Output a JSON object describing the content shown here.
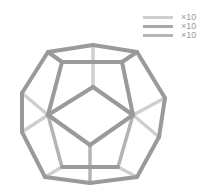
{
  "figure": {
    "type": "dodecahedron-wireframe",
    "colors": {
      "front": "#9a9a9a",
      "mid": "#b4b4b4",
      "back": "#cfcfcf"
    },
    "vertices": {
      "o0": [
        48,
        52
      ],
      "o1": [
        93,
        45
      ],
      "o2": [
        137,
        52
      ],
      "o3": [
        165,
        98
      ],
      "o4": [
        159,
        137
      ],
      "o5": [
        137,
        177
      ],
      "o6": [
        90,
        183
      ],
      "o7": [
        45,
        177
      ],
      "o8": [
        22,
        132
      ],
      "o9": [
        22,
        93
      ],
      "t0": [
        62,
        62
      ],
      "t1": [
        122,
        62
      ],
      "d0": [
        93,
        87
      ],
      "d1": [
        133,
        115
      ],
      "d2": [
        90,
        145
      ],
      "d3": [
        48,
        115
      ],
      "b0": [
        62,
        167
      ],
      "b1": [
        118,
        167
      ],
      "hR": [
        133,
        115
      ],
      "hL": [
        48,
        115
      ],
      "bx": [
        90,
        145
      ],
      "topc": [
        93,
        45
      ]
    },
    "edges": [
      {
        "a": "o0",
        "b": "o1",
        "layer": "front"
      },
      {
        "a": "o1",
        "b": "o2",
        "layer": "front"
      },
      {
        "a": "o2",
        "b": "o3",
        "layer": "front"
      },
      {
        "a": "o3",
        "b": "o4",
        "layer": "front"
      },
      {
        "a": "o4",
        "b": "o5",
        "layer": "front"
      },
      {
        "a": "o5",
        "b": "o6",
        "layer": "front"
      },
      {
        "a": "o6",
        "b": "o7",
        "layer": "front"
      },
      {
        "a": "o7",
        "b": "o8",
        "layer": "front"
      },
      {
        "a": "o8",
        "b": "o9",
        "layer": "front"
      },
      {
        "a": "o9",
        "b": "o0",
        "layer": "front"
      },
      {
        "a": "o0",
        "b": "t0",
        "layer": "front"
      },
      {
        "a": "t0",
        "b": "t1",
        "layer": "front"
      },
      {
        "a": "t1",
        "b": "o2",
        "layer": "front"
      },
      {
        "a": "t0",
        "b": "d3",
        "layer": "front"
      },
      {
        "a": "t1",
        "b": "d1",
        "layer": "front"
      },
      {
        "a": "d0",
        "b": "d1",
        "layer": "front"
      },
      {
        "a": "d1",
        "b": "d2",
        "layer": "front"
      },
      {
        "a": "d2",
        "b": "d3",
        "layer": "front"
      },
      {
        "a": "d3",
        "b": "d0",
        "layer": "front"
      },
      {
        "a": "b0",
        "b": "b1",
        "layer": "front"
      },
      {
        "a": "o1",
        "b": "d0",
        "layer": "back"
      },
      {
        "a": "o9",
        "b": "d3",
        "layer": "back"
      },
      {
        "a": "d3",
        "b": "o8",
        "layer": "back"
      },
      {
        "a": "o3",
        "b": "d1",
        "layer": "back"
      },
      {
        "a": "d1",
        "b": "o4",
        "layer": "back"
      },
      {
        "a": "d3",
        "b": "b0",
        "layer": "mid"
      },
      {
        "a": "d1",
        "b": "b1",
        "layer": "mid"
      },
      {
        "a": "d2",
        "b": "o6",
        "layer": "mid"
      },
      {
        "a": "b0",
        "b": "o7",
        "layer": "back"
      },
      {
        "a": "b1",
        "b": "o5",
        "layer": "back"
      }
    ]
  },
  "legend": {
    "items": [
      {
        "label": "×10",
        "color": "#cfcfcf"
      },
      {
        "label": "×10",
        "color": "#a8a8a8"
      },
      {
        "label": "×10",
        "color": "#b4b4b4"
      }
    ]
  }
}
